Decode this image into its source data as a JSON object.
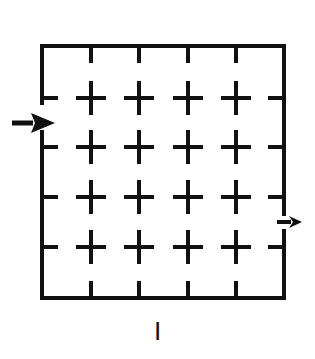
{
  "figure": {
    "caption": "I",
    "stroke_color": "#111111",
    "background": "#ffffff"
  },
  "box": {
    "left": 42,
    "top": 46,
    "right": 284,
    "bottom": 298,
    "stroke_width": 4,
    "entry_gap": {
      "side": "left",
      "y_from": 103,
      "y_to": 132
    },
    "exit_gap": {
      "side": "right",
      "y_from": 214,
      "y_to": 231
    }
  },
  "grid": {
    "columns_x": [
      91,
      139,
      188,
      236
    ],
    "rows_y": [
      98,
      147,
      197,
      247
    ],
    "arm_half_length": 13,
    "stroke_width": 4,
    "marker": "plus"
  },
  "arrows": [
    {
      "name": "entry-arrow",
      "direction": "right",
      "x1": 12,
      "x2": 55,
      "y": 123,
      "size": "large"
    },
    {
      "name": "exit-arrow",
      "direction": "right",
      "x1": 277,
      "x2": 302,
      "y": 222,
      "size": "small"
    }
  ]
}
